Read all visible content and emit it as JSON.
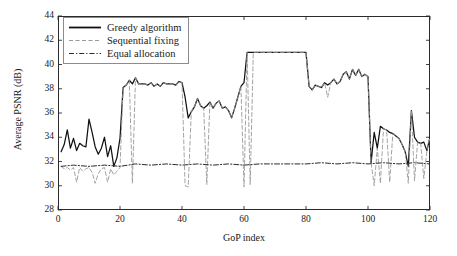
{
  "chart_data": {
    "type": "line",
    "title": "",
    "xlabel": "GoP index",
    "ylabel": "Average PSNR (dB)",
    "xlim": [
      0,
      120
    ],
    "ylim": [
      28,
      44
    ],
    "xticks": [
      0,
      20,
      40,
      60,
      80,
      100,
      120
    ],
    "yticks": [
      28,
      30,
      32,
      34,
      36,
      38,
      40,
      42,
      44
    ],
    "grid": false,
    "legend_position": "top-left",
    "series": [
      {
        "name": "Greedy algorithm",
        "style": "solid",
        "color": "#111111",
        "x": [
          1,
          2,
          3,
          4,
          5,
          6,
          7,
          8,
          9,
          10,
          11,
          12,
          13,
          14,
          15,
          16,
          17,
          18,
          19,
          20,
          21,
          22,
          23,
          24,
          25,
          26,
          27,
          28,
          29,
          30,
          31,
          32,
          33,
          34,
          35,
          36,
          37,
          38,
          39,
          40,
          41,
          42,
          43,
          44,
          45,
          46,
          47,
          48,
          49,
          50,
          51,
          52,
          53,
          54,
          55,
          56,
          57,
          58,
          59,
          60,
          61,
          62,
          63,
          64,
          65,
          66,
          67,
          68,
          69,
          70,
          71,
          72,
          73,
          74,
          75,
          76,
          77,
          78,
          79,
          80,
          81,
          82,
          83,
          84,
          85,
          86,
          87,
          88,
          89,
          90,
          91,
          92,
          93,
          94,
          95,
          96,
          97,
          98,
          99,
          100,
          101,
          102,
          103,
          104,
          105,
          106,
          107,
          108,
          109,
          110,
          111,
          112,
          113,
          114,
          115,
          116,
          117,
          118,
          119,
          120
        ],
        "y": [
          32.8,
          33.4,
          34.6,
          33.1,
          33.9,
          32.9,
          33.5,
          33.3,
          33.2,
          35.5,
          34.4,
          33.2,
          32.6,
          33.1,
          34.0,
          32.4,
          33.3,
          31.6,
          32.3,
          33.9,
          38.1,
          38.3,
          38.7,
          38.4,
          38.9,
          38.4,
          38.4,
          38.4,
          38.3,
          38.5,
          38.2,
          38.4,
          38.2,
          38.5,
          38.4,
          38.4,
          38.4,
          38.3,
          38.6,
          38.5,
          37.3,
          35.6,
          36.1,
          36.5,
          37.2,
          36.6,
          36.4,
          36.6,
          36.9,
          36.4,
          36.8,
          37.0,
          36.4,
          36.5,
          36.2,
          35.6,
          36.4,
          37.3,
          38.2,
          38.5,
          41.0,
          41.0,
          41.0,
          41.0,
          41.0,
          41.0,
          41.0,
          41.0,
          41.0,
          41.0,
          41.0,
          41.0,
          41.0,
          41.0,
          41.0,
          41.0,
          41.0,
          41.0,
          41.0,
          41.0,
          38.2,
          37.9,
          38.3,
          38.2,
          38.1,
          38.5,
          38.3,
          38.5,
          38.8,
          38.4,
          38.6,
          39.2,
          39.4,
          38.8,
          39.6,
          39.1,
          39.6,
          39.0,
          39.2,
          39.0,
          31.9,
          34.4,
          33.1,
          34.9,
          34.7,
          34.6,
          34.4,
          34.3,
          34.1,
          33.9,
          33.4,
          32.8,
          31.6,
          36.2,
          34.0,
          33.6,
          33.5,
          33.6,
          32.9,
          34.0
        ]
      },
      {
        "name": "Sequential fixing",
        "style": "dashed",
        "color": "#9a9a9a",
        "x": [
          1,
          2,
          3,
          4,
          5,
          6,
          7,
          8,
          9,
          10,
          11,
          12,
          13,
          14,
          15,
          16,
          17,
          18,
          19,
          20,
          21,
          22,
          23,
          24,
          25,
          26,
          27,
          28,
          29,
          30,
          31,
          32,
          33,
          34,
          35,
          36,
          37,
          38,
          39,
          40,
          41,
          42,
          43,
          44,
          45,
          46,
          47,
          48,
          49,
          50,
          51,
          52,
          53,
          54,
          55,
          56,
          57,
          58,
          59,
          60,
          61,
          62,
          63,
          64,
          65,
          66,
          67,
          68,
          69,
          70,
          71,
          72,
          73,
          74,
          75,
          76,
          77,
          78,
          79,
          80,
          81,
          82,
          83,
          84,
          85,
          86,
          87,
          88,
          89,
          90,
          91,
          92,
          93,
          94,
          95,
          96,
          97,
          98,
          99,
          100,
          101,
          102,
          103,
          104,
          105,
          106,
          107,
          108,
          109,
          110,
          111,
          112,
          113,
          114,
          115,
          116,
          117,
          118,
          119,
          120
        ],
        "y": [
          31.6,
          31.4,
          31.5,
          31.3,
          31.5,
          30.3,
          31.5,
          31.2,
          31.4,
          31.5,
          31.1,
          30.2,
          31.0,
          31.4,
          31.5,
          30.3,
          31.4,
          30.9,
          31.2,
          31.5,
          38.1,
          38.3,
          38.7,
          30.2,
          38.9,
          38.4,
          38.4,
          38.4,
          38.3,
          38.5,
          38.2,
          38.4,
          38.2,
          38.5,
          38.4,
          38.4,
          38.4,
          38.3,
          38.6,
          38.5,
          30.0,
          29.9,
          36.1,
          36.5,
          37.2,
          36.6,
          36.4,
          30.1,
          36.9,
          36.4,
          36.8,
          37.0,
          36.4,
          36.5,
          36.2,
          35.6,
          36.4,
          37.3,
          38.2,
          29.9,
          41.0,
          30.1,
          41.0,
          41.0,
          41.0,
          41.0,
          41.0,
          41.0,
          41.0,
          41.0,
          41.0,
          41.0,
          41.0,
          41.0,
          41.0,
          41.0,
          41.0,
          41.0,
          41.0,
          41.0,
          38.2,
          37.9,
          38.3,
          38.2,
          38.1,
          38.5,
          37.3,
          38.5,
          38.8,
          38.4,
          38.6,
          39.2,
          39.4,
          38.8,
          39.6,
          39.1,
          39.6,
          39.0,
          39.2,
          39.0,
          31.9,
          30.0,
          33.1,
          30.2,
          34.7,
          34.6,
          30.3,
          34.3,
          34.1,
          33.9,
          33.4,
          32.8,
          30.2,
          36.2,
          30.4,
          33.6,
          33.5,
          30.6,
          32.9,
          34.0
        ]
      },
      {
        "name": "Equal allocation",
        "style": "dashdot",
        "color": "#2b2b2b",
        "x": [
          1,
          5,
          10,
          15,
          20,
          25,
          30,
          35,
          40,
          45,
          50,
          55,
          60,
          65,
          70,
          75,
          80,
          85,
          90,
          95,
          100,
          105,
          110,
          115,
          120
        ],
        "y": [
          31.6,
          31.7,
          31.6,
          31.7,
          31.6,
          31.8,
          31.7,
          31.8,
          31.7,
          31.8,
          31.7,
          31.8,
          31.7,
          31.8,
          31.8,
          31.8,
          31.8,
          31.9,
          31.8,
          31.9,
          31.8,
          31.9,
          31.8,
          31.9,
          31.8
        ]
      }
    ]
  },
  "legend": {
    "items": [
      {
        "label": "Greedy algorithm",
        "style": "solid"
      },
      {
        "label": "Sequential fixing",
        "style": "dashed"
      },
      {
        "label": "Equal allocation",
        "style": "dashdot"
      }
    ]
  }
}
